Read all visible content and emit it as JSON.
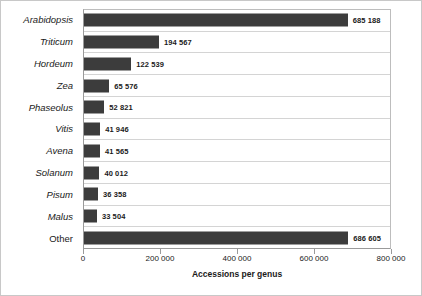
{
  "chart_data": {
    "type": "bar",
    "orientation": "horizontal",
    "title": "",
    "xlabel": "Accessions per genus",
    "ylabel": "",
    "xlim": [
      0,
      800000
    ],
    "grid": true,
    "legend": null,
    "bar_color": "#3c3c3c",
    "categories": [
      "Arabidopsis",
      "Triticum",
      "Hordeum",
      "Zea",
      "Phaseolus",
      "Vitis",
      "Avena",
      "Solanum",
      "Pisum",
      "Malus",
      "Other"
    ],
    "values": [
      685188,
      194567,
      122539,
      65576,
      52821,
      41946,
      41565,
      40012,
      36358,
      33504,
      686605
    ],
    "value_labels": [
      "685 188",
      "194 567",
      "122 539",
      "65 576",
      "52 821",
      "41 946",
      "41 565",
      "40 012",
      "36 358",
      "33 504",
      "686 605"
    ],
    "category_styles": [
      "italic",
      "italic",
      "italic",
      "italic",
      "italic",
      "italic",
      "italic",
      "italic",
      "italic",
      "italic",
      "upright"
    ],
    "xticks": [
      0,
      200000,
      400000,
      600000,
      800000
    ],
    "xtick_labels": [
      "0",
      "200 000",
      "400 000",
      "600 000",
      "800 000"
    ]
  }
}
